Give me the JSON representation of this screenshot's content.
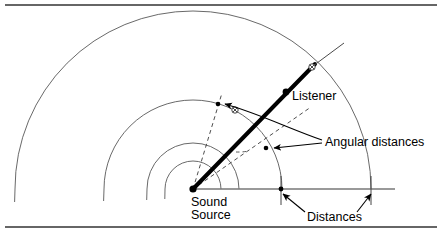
{
  "figure": {
    "kind": "geometry-diagram",
    "title_visible": false,
    "background_color": "#ffffff",
    "ink_color": "#000000",
    "arc_color": "#555555",
    "rule_color": "#333333",
    "labels": {
      "sound_source_line1": "Sound",
      "sound_source_line2": "Source",
      "listener": "Listener",
      "angular_distances": "Angular distances",
      "distances": "Distances"
    },
    "geometry": {
      "center": {
        "x": 193,
        "y": 189
      },
      "arc_radii": [
        28,
        46,
        89,
        178
      ],
      "arc_sweep_deg": {
        "start": 0,
        "end": 182
      },
      "listener_ray_deg": 62,
      "listener_dot": {
        "x": 286,
        "y": 92
      },
      "outer_marker": {
        "x": 312,
        "y": 67
      },
      "middle_marker": {
        "x": 236,
        "y": 110
      },
      "dashed_rays_deg": [
        73,
        35
      ],
      "baseline": {
        "x1": 193,
        "x2": 393,
        "y": 189
      },
      "distance_ticks_x": [
        281,
        372
      ]
    }
  },
  "rules": {
    "top_rule_y": 5,
    "bottom_rule_y": 227
  }
}
